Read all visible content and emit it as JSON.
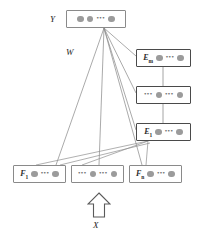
{
  "diagram": {
    "colors": {
      "dot": "#9b9b9b",
      "box_border": "#8a8a8a",
      "box_border_strong": "#4a4a4a",
      "edge": "#8e8e8e",
      "text": "#1e1e1e",
      "background": "#ffffff"
    },
    "labels": {
      "output": "Y",
      "weights": "W",
      "input": "X"
    },
    "ellipsis": "•••",
    "nodes": {
      "output_layer": {
        "id": "Y",
        "label": "",
        "units": [
          "dot",
          "dot",
          "ellipsis",
          "dot"
        ]
      },
      "expert_layers": [
        {
          "id": "E_m",
          "label": "E",
          "subscript": "m",
          "units": [
            "dot",
            "ellipsis",
            "dot"
          ]
        },
        {
          "id": "E_mid",
          "label": "",
          "subscript": "",
          "units": [
            "ellipsis",
            "dot",
            "ellipsis",
            "dot"
          ]
        },
        {
          "id": "E_1",
          "label": "E",
          "subscript": "1",
          "units": [
            "dot",
            "ellipsis",
            "dot"
          ]
        }
      ],
      "feature_layers": [
        {
          "id": "F_1",
          "label": "F",
          "subscript": "1",
          "units": [
            "dot",
            "ellipsis",
            "dot"
          ]
        },
        {
          "id": "F_mid",
          "label": "",
          "subscript": "",
          "units": [
            "ellipsis",
            "dot",
            "ellipsis",
            "dot"
          ]
        },
        {
          "id": "F_n",
          "label": "F",
          "subscript": "n",
          "units": [
            "dot",
            "ellipsis",
            "dot"
          ]
        }
      ]
    }
  }
}
